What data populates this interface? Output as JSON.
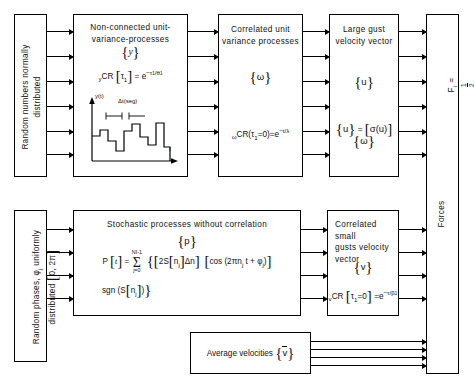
{
  "diagram": {
    "width": 474,
    "height": 390
  },
  "blocks": {
    "random_numbers": {
      "label": "Random numbers normally\ndistributed",
      "orientation": "vertical"
    },
    "non_connected": {
      "title": "Non-connected unit-\nvariance-processes",
      "symbol": "{y}",
      "formula": "yCR [τ1] = e−τ1/θ1",
      "chart": {
        "ylabel": "y(t)",
        "xlabel": "t",
        "annotation": "Δt(seg)"
      }
    },
    "correlated_unit": {
      "title": "Correlated unit\nvariance processes",
      "symbol": "{ω}",
      "formula": "ωCR(τ1=0)=e−t/λ"
    },
    "large_gust": {
      "title": "Large gust\nvelocity vector",
      "symbol": "{u}",
      "formula": "{u} = [σ(u)] {ω}"
    },
    "forces": {
      "formula": "Fi = 1/2 CDρAi (Vi + ui + vi)2 Xo",
      "label": "Forces",
      "orientation": "vertical"
    },
    "random_phases": {
      "label": "Random phases, φj uniformly\ndistributed [0, 2π]",
      "orientation": "vertical"
    },
    "stochastic": {
      "title": "Stochastic processes without correlation",
      "symbol": "{p}",
      "formula_line1": "P [t] = Σ j=0 NI-1 { [2S[nj]Δn]  [cos (2πnj t + φj)]",
      "formula_line2": "sgn (S[nj]) }",
      "sum_upper": "NI-1",
      "sum_lower": "j=0"
    },
    "small_gusts": {
      "title": "Correlated small\ngusts velocity\nvector",
      "symbol": "{v}",
      "formula": "vCR [τ1=0] = e−τ/β1"
    },
    "average_velocities": {
      "label": "Average velocities",
      "symbol": "{v̄}"
    }
  },
  "colors": {
    "stroke": "#000000",
    "background": "#ffffff"
  }
}
